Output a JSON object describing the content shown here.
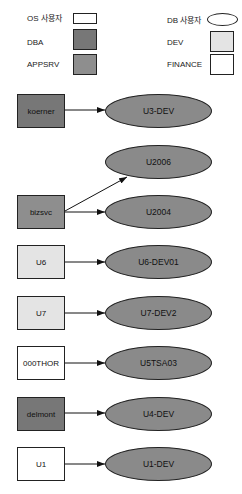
{
  "legend": {
    "os_user": "OS 사용자",
    "db_user": "DB 사용자",
    "dba": "DBA",
    "appsrv": "APPSRV",
    "dev": "DEV",
    "finance": "FINANCE"
  },
  "colors": {
    "dba": "#777777",
    "appsrv": "#8e8e8e",
    "dev": "#e4e4e4",
    "finance": "#ffffff",
    "os": "#ffffff",
    "db": "#8a8a8a"
  },
  "nodes": {
    "koerner": "koerner",
    "u3dev": "U3-DEV",
    "bizsvc": "bizsvc",
    "u2006": "U2006",
    "u2004": "U2004",
    "u6": "U6",
    "u6dev01": "U6-DEV01",
    "u7": "U7",
    "u7dev2": "U7-DEV2",
    "thor": "000THOR",
    "u5tsa03": "U5TSA03",
    "delmont": "delmont",
    "u4dev": "U4-DEV",
    "u1": "U1",
    "u1dev": "U1-DEV"
  }
}
